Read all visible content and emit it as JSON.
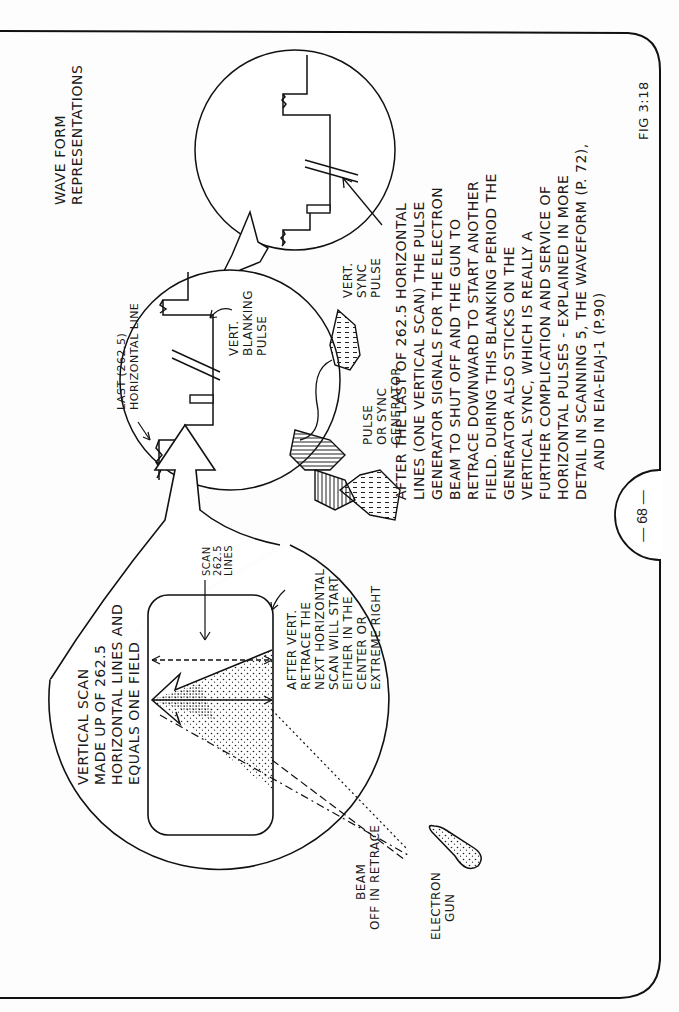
{
  "page": {
    "page_number": "— 68 —",
    "figure_label": "FIG 3:18",
    "orientation": "rotated 90° counter-clockwise (text reads bottom-to-top)"
  },
  "labels": {
    "waveform_title": [
      "WAVE FORM",
      "REPRESENTATIONS"
    ],
    "vert_sync_pulse": [
      "VERT.",
      "SYNC",
      "PULSE"
    ],
    "last_horizontal_line": [
      "LAST (262.5)",
      "HORIZONTAL LINE"
    ],
    "vert_blanking_pulse": [
      "VERT.",
      "BLANKING",
      "PULSE"
    ],
    "pulse_sync_generator": [
      "PULSE",
      "OR SYNC",
      "GENERATOR"
    ],
    "vertical_scan": [
      "VERTICAL SCAN",
      "MADE UP OF 262.5",
      "HORIZONTAL LINES AND",
      "EQUALS ONE FIELD"
    ],
    "scan_lines": [
      "SCAN",
      "262.5",
      "LINES"
    ],
    "after_retrace": [
      "AFTER VERT.",
      "RETRACE THE",
      "NEXT HORIZONTAL",
      "SCAN WILL START",
      "EITHER IN THE",
      "CENTER OR",
      "EXTREME RIGHT"
    ],
    "beam_off": [
      "BEAM",
      "OFF IN RETRACE"
    ],
    "electron_gun": [
      "ELECTRON",
      "GUN"
    ]
  },
  "explanation": [
    "AFTER THE LAST OF 262.5 HORIZONTAL",
    "LINES (ONE VERTICAL SCAN) THE PULSE",
    "GENERATOR SIGNALS FOR THE ELECTRON",
    "BEAM TO SHUT OFF AND THE GUN TO",
    "RETRACE DOWNWARD TO START ANOTHER",
    "FIELD. DURING THIS BLANKING PERIOD THE",
    "GENERATOR ALSO STICKS ON THE",
    "VERTICAL SYNC, WHICH IS REALLY A",
    "FURTHER COMPLICATION AND SERVICE OF",
    "HORIZONTAL PULSES - EXPLAINED IN MORE",
    "DETAIL IN SCANNING 5, THE WAVEFORM (P. 72),",
    "AND IN EIA-EIAJ-1 (P.90)"
  ]
}
